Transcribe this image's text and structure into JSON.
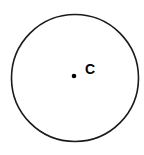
{
  "figure": {
    "name": "circle-with-center-point",
    "canvas": {
      "width": 144,
      "height": 155
    },
    "background_color": "#ffffff",
    "stroke_color": "#1a1a1a",
    "fill_color": "#ffffff",
    "point_color": "#000000",
    "label_color": "#000000"
  },
  "chart_data": {
    "type": "diagram",
    "title": "",
    "subtitle": "",
    "xlabel": "",
    "ylabel": "",
    "shapes": [
      {
        "kind": "circle",
        "name": "main-circle",
        "cx": 75,
        "cy": 78,
        "r": 63.5,
        "stroke": "#1a1a1a",
        "stroke_width": 1.6,
        "fill": "none"
      },
      {
        "kind": "point",
        "name": "center-point",
        "cx": 74,
        "cy": 76,
        "r": 2.3,
        "fill": "#000000"
      }
    ],
    "annotations": [
      {
        "name": "center-label",
        "text": "C",
        "x": 85,
        "y": 74,
        "font_size": 14,
        "font_weight": "bold",
        "color": "#000000"
      }
    ],
    "legend": [],
    "grid": false,
    "axes": false
  },
  "labels": {
    "center": "C"
  }
}
